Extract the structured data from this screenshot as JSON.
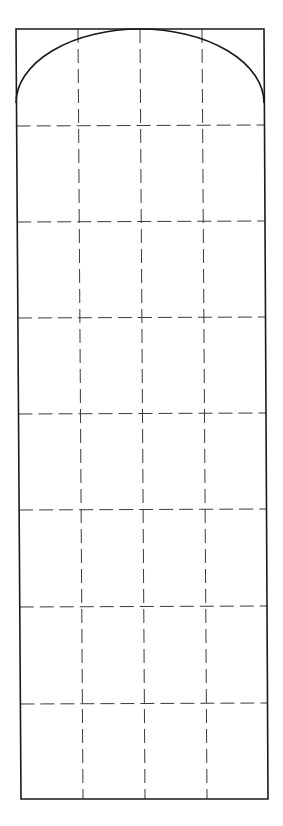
{
  "diagram": {
    "type": "arched-panel-grid",
    "stroke_color": "#1a1a1a",
    "dash_color": "#3a3a3a",
    "background": "#ffffff",
    "outline": {
      "top_left": [
        16,
        29
      ],
      "top_right": [
        264,
        29
      ],
      "bottom_left": [
        21,
        799
      ],
      "bottom_right": [
        268,
        799
      ]
    },
    "arch": {
      "start": [
        16,
        103
      ],
      "apex": [
        140,
        29
      ],
      "end": [
        264,
        103
      ]
    },
    "vertical_dashed_lines": [
      {
        "top": [
          78,
          29
        ],
        "bottom": [
          83,
          799
        ]
      },
      {
        "top": [
          140,
          29
        ],
        "bottom": [
          145,
          799
        ]
      },
      {
        "top": [
          202,
          29
        ],
        "bottom": [
          207,
          799
        ]
      }
    ],
    "horizontal_dashed_lines_y": [
      126,
      222,
      318,
      414,
      510,
      607,
      704
    ],
    "grid": {
      "columns": 4,
      "rows": 8
    }
  }
}
